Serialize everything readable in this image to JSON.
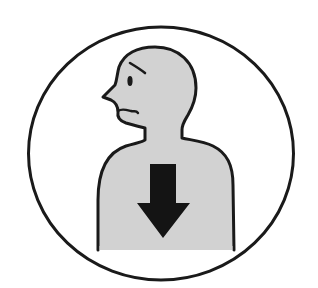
{
  "pictogram": {
    "description": "Worried person in profile with a downward arrow on the chest",
    "colors": {
      "background": "#ffffff",
      "outline": "#1a1a1a",
      "body_fill": "#d2d2d2",
      "arrow": "#141414"
    },
    "icons": [
      "circle-frame-icon",
      "person-silhouette-icon",
      "worried-face-icon",
      "down-arrow-icon"
    ]
  }
}
